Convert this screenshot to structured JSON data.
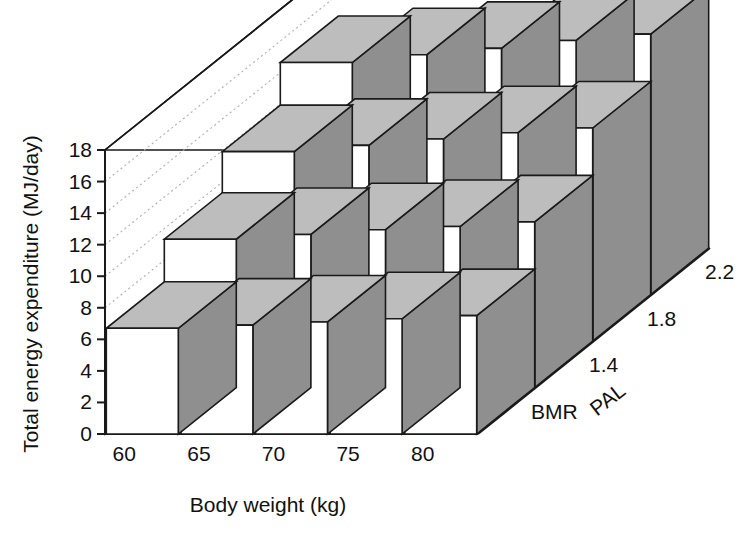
{
  "chart_data": {
    "type": "bar",
    "title": "",
    "subtitle": "",
    "xlabel": "Body weight (kg)",
    "ylabel": "Total energy expenditure (MJ/day)",
    "zlabel": "PAL",
    "categories": [
      "60",
      "65",
      "70",
      "75",
      "80"
    ],
    "depth_categories": [
      "BMR",
      "1.4",
      "1.8",
      "2.2"
    ],
    "ylim": [
      0,
      18
    ],
    "yticks": [
      "0",
      "2",
      "4",
      "6",
      "8",
      "10",
      "12",
      "14",
      "16",
      "18"
    ],
    "ytick_values": [
      0,
      2,
      4,
      6,
      8,
      10,
      12,
      14,
      16,
      18
    ],
    "grid": true,
    "legend": "none",
    "series": [
      {
        "name": "BMR",
        "values": [
          6.7,
          6.9,
          7.1,
          7.3,
          7.5
        ]
      },
      {
        "name": "1.4",
        "values": [
          9.4,
          9.7,
          10.0,
          10.2,
          10.5
        ]
      },
      {
        "name": "1.8",
        "values": [
          12.0,
          12.4,
          12.8,
          13.2,
          13.5
        ]
      },
      {
        "name": "2.2",
        "values": [
          14.7,
          15.2,
          15.6,
          16.1,
          16.5
        ]
      }
    ],
    "colors": {
      "bar_front": "#ffffff",
      "bar_top": "#bdbdbd",
      "bar_side": "#8f8f8f",
      "outline": "#1a1a1a",
      "gridline": "#b0b0b0",
      "background": "#ffffff"
    }
  }
}
